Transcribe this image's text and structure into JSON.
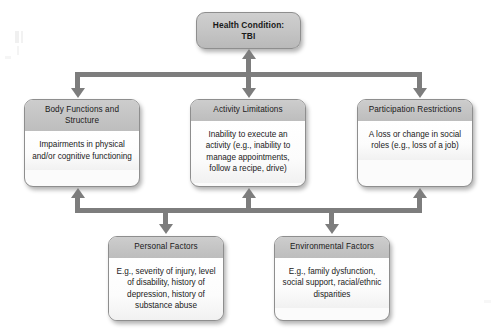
{
  "diagram": {
    "colors": {
      "connector": "#7d7d7d",
      "header_gray": "#c4c4c4",
      "body_white": "#fbfbfb",
      "border": "#8e8e8e",
      "background": "#ffffff",
      "text": "#1a1a1a"
    },
    "nodes": {
      "health_condition": {
        "header": "Health Condition:",
        "header_line2": "TBI",
        "body": ""
      },
      "body_functions": {
        "header": "Body Functions and Structure",
        "body": "Impairments in physical and/or cognitive functioning"
      },
      "activity_limitations": {
        "header": "Activity Limitations",
        "body": "Inability to execute an activity (e.g., inability to manage appointments, follow a recipe, drive)"
      },
      "participation_restrictions": {
        "header": "Participation Restrictions",
        "body": "A loss or change in social roles (e.g., loss of a job)"
      },
      "personal_factors": {
        "header": "Personal Factors",
        "body": "E.g., severity of injury, level of disability, history of depression, history of substance abuse"
      },
      "environmental_factors": {
        "header": "Environmental Factors",
        "body": "E.g., family dysfunction, social support, racial/ethnic disparities"
      }
    },
    "connectors": [
      {
        "name": "health-to-activity-bidirectional",
        "type": "double-arrow-vertical"
      },
      {
        "name": "bus-to-body-functions",
        "type": "arrow-down"
      },
      {
        "name": "bus-to-participation",
        "type": "arrow-down"
      },
      {
        "name": "contextual-bus-to-body-functions",
        "type": "arrow-up"
      },
      {
        "name": "contextual-bus-to-activity",
        "type": "arrow-up"
      },
      {
        "name": "contextual-bus-to-participation",
        "type": "arrow-up"
      },
      {
        "name": "contextual-bus-to-personal-factors",
        "type": "arrow-down"
      },
      {
        "name": "contextual-bus-to-environmental-factors",
        "type": "arrow-down"
      }
    ]
  }
}
